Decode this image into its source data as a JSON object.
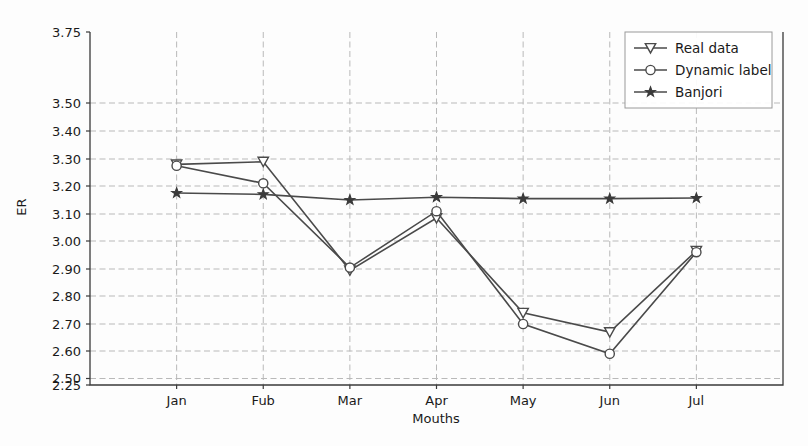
{
  "chart_data": {
    "type": "line",
    "title": "",
    "xlabel": "Mouths",
    "ylabel": "ER",
    "categories": [
      "Jan",
      "Fub",
      "Mar",
      "Apr",
      "May",
      "Jun",
      "Jul"
    ],
    "ytick_labels": [
      "3.75",
      "3.50",
      "3.40",
      "3.30",
      "3.20",
      "3.10",
      "3.00",
      "2.90",
      "2.80",
      "2.70",
      "2.60",
      "2.50",
      "2.25"
    ],
    "ytick_values": [
      3.75,
      3.5,
      3.4,
      3.3,
      3.2,
      3.1,
      3.0,
      2.9,
      2.8,
      2.7,
      2.6,
      2.5,
      2.25
    ],
    "ylim": [
      2.25,
      3.75
    ],
    "xlim": [
      0,
      8
    ],
    "grid": true,
    "grid_style": "dashed",
    "legend_position": "upper right",
    "series": [
      {
        "name": "Real data",
        "marker": "triangle-down",
        "values": [
          3.28,
          3.29,
          2.895,
          3.085,
          2.74,
          2.67,
          2.965
        ]
      },
      {
        "name": "Dynamic label",
        "marker": "circle",
        "values": [
          3.275,
          3.21,
          2.905,
          3.11,
          2.7,
          2.59,
          2.96
        ]
      },
      {
        "name": "Banjori",
        "marker": "star",
        "values": [
          3.175,
          3.17,
          3.15,
          3.16,
          3.155,
          3.155,
          3.157
        ]
      }
    ]
  },
  "colors": {
    "line": "#4a4a4a",
    "grid": "#b9b9b9",
    "axis": "#3a3a3a",
    "background": "#fdfdfd"
  }
}
